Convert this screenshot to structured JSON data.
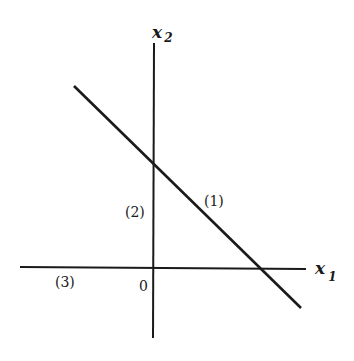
{
  "diagram": {
    "type": "coordinate-plane-with-line",
    "axes": {
      "horizontal": {
        "label": "x",
        "subscript": "1"
      },
      "vertical": {
        "label": "x",
        "subscript": "2"
      },
      "origin_label": "0"
    },
    "line": {
      "description": "downward-sloping line crossing both positive axes"
    },
    "region_labels": [
      {
        "id": "1",
        "text": "(1)",
        "position": "next to the sloping line, first quadrant"
      },
      {
        "id": "2",
        "text": "(2)",
        "position": "left of the vertical axis, below the line intercept"
      },
      {
        "id": "3",
        "text": "(3)",
        "position": "below-left along the horizontal axis"
      }
    ]
  },
  "colors": {
    "stroke": "#1a1a1a",
    "background": "#ffffff"
  }
}
